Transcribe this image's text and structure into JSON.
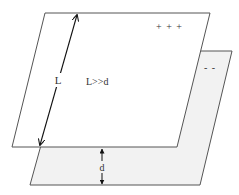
{
  "diagram": {
    "type": "parallel-plate-capacitor",
    "top_plate": {
      "charge_label": "+ + +",
      "fill": "#ffffff",
      "stroke": "#555555"
    },
    "bottom_plate": {
      "charge_label": "- -",
      "fill": "#f2f2f2",
      "stroke": "#555555"
    },
    "length_label": "L",
    "condition_label": "L>>d",
    "separation_label": "d"
  }
}
